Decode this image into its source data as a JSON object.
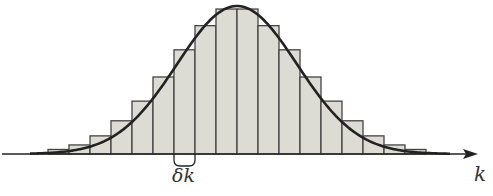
{
  "diagram": {
    "title": "",
    "axis": {
      "label": "k"
    },
    "bar_width_label": "δk",
    "colors": {
      "bar_fill": "#dcdcd4",
      "bar_stroke": "#444444",
      "curve": "#222222",
      "axis": "#222222",
      "text": "#333333"
    }
  },
  "chart_data": {
    "type": "bar",
    "title": "",
    "xlabel": "k",
    "ylabel": "",
    "annotation": "δk",
    "bar_heights_relative": [
      0.03,
      0.06,
      0.12,
      0.22,
      0.35,
      0.51,
      0.69,
      0.85,
      0.96,
      0.96,
      0.85,
      0.69,
      0.51,
      0.35,
      0.22,
      0.12,
      0.06,
      0.03
    ],
    "curve": "gaussian"
  }
}
